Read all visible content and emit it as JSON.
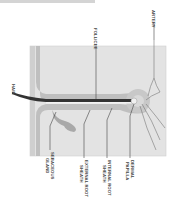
{
  "diagram": {
    "orientation": "rotated 90 degrees counterclockwise",
    "colors": {
      "skin_surface": "#d9d9d9",
      "dermis": "#e6e6e6",
      "epidermis_band": "#b4b4b4",
      "shaft": "#3a3a3a",
      "sheath": "#bdbdbd",
      "gland": "#a8a8a8",
      "line": "#555555"
    },
    "labels": {
      "hair": "HAIR",
      "follicle": "FOLLICLE",
      "artery": "ARTERY",
      "sebaceous_line1": "SEBACEOUS",
      "sebaceous_line2": "GLAND",
      "external_line1": "EXTERNAL ROOT",
      "external_line2": "SHEATH",
      "internal_line1": "INTERNAL ROOT",
      "internal_line2": "SHEATH",
      "dermal_line1": "DERMAL",
      "dermal_line2": "PAPILLA"
    }
  }
}
